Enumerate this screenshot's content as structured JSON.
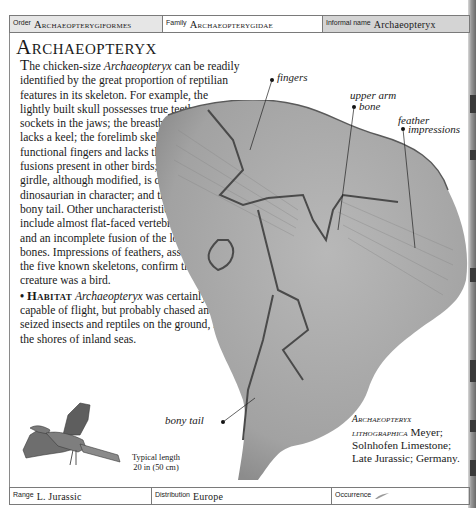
{
  "header": {
    "order": {
      "label": "Order",
      "value": "Archaeopterygiformes"
    },
    "family": {
      "label": "Family",
      "value": "Archaeopterygidae"
    },
    "informal_name": {
      "label": "Informal name",
      "value": "Archaeopteryx"
    }
  },
  "title": "Archaeopteryx",
  "description": {
    "dropcap": "T",
    "text_1": "he chicken-size ",
    "italic_1": "Archaeopteryx",
    "text_2": " can be readily identified by the great proportion of reptilian features in its skeleton. For example, the lightly built skull possesses true teeth, set in sockets in the jaws; the breastbone is small and lacks a keel; the forelimb skeleton retains three functional fingers and lacks the reductions and fusions present in other birds; the hindlimb girdle, although modified, is distinctly dinosaurian in character; and there is a long bony tail. Other uncharacteristic avian features include almost flat-faced vertebrae, belly ribs, and an incomplete fusion of the lower leg bones. Impressions of feathers, associated with the five known skeletons, confirm that this creature was a bird."
  },
  "habitat": {
    "bullet": "•",
    "heading": "Habitat",
    "italic": "Archaeopteryx",
    "text": " was certainly capable of flight, but probably chased and seized insects and reptiles on the ground, near the shores of inland seas."
  },
  "annotations": {
    "fingers": "fingers",
    "upper_arm_bone_1": "upper arm",
    "upper_arm_bone_2": "bone",
    "feather_impressions_1": "feather",
    "feather_impressions_2": "impressions",
    "bony_tail": "bony tail"
  },
  "specimen_caption": {
    "species_1": "Archaeopteryx",
    "species_2": "lithographica",
    "author": " Meyer;",
    "line_2": "Solnhofen Limestone;",
    "line_3": "Late Jurassic; Germany."
  },
  "typical_length": {
    "line_1": "Typical length",
    "line_2": "20 in (50 cm)"
  },
  "footer": {
    "range": {
      "label": "Range",
      "value": "L. Jurassic"
    },
    "distribution": {
      "label": "Distribution",
      "value": "Europe"
    },
    "occurrence": {
      "label": "Occurrence",
      "icon": "feather-icon"
    }
  },
  "colors": {
    "header_shade": "#e6e6e6",
    "informal_shade": "#d4d4d4",
    "fossil_slab": "#a9a9a9"
  }
}
